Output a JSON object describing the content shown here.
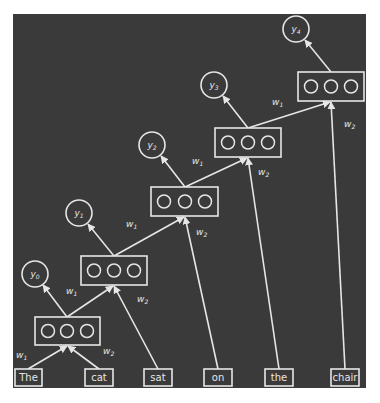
{
  "diagram": {
    "type": "recursive-neural-network (left-branching tree)",
    "colors": {
      "background": "#3a3a3a",
      "foreground": "#e6e6e6",
      "page": "#ffffff"
    },
    "words": [
      {
        "id": "w_the",
        "label": "The"
      },
      {
        "id": "w_cat",
        "label": "cat"
      },
      {
        "id": "w_sat",
        "label": "sat"
      },
      {
        "id": "w_on",
        "label": "on"
      },
      {
        "id": "w_the2",
        "label": "the"
      },
      {
        "id": "w_chair",
        "label": "chair"
      }
    ],
    "hidden_nodes": [
      {
        "id": "h0",
        "units": 3
      },
      {
        "id": "h1",
        "units": 3
      },
      {
        "id": "h2",
        "units": 3
      },
      {
        "id": "h3",
        "units": 3
      },
      {
        "id": "h4",
        "units": 3
      }
    ],
    "outputs": [
      {
        "id": "y0",
        "base": "y",
        "sub": "0"
      },
      {
        "id": "y1",
        "base": "y",
        "sub": "1"
      },
      {
        "id": "y2",
        "base": "y",
        "sub": "2"
      },
      {
        "id": "y3",
        "base": "y",
        "sub": "3"
      },
      {
        "id": "y4",
        "base": "y",
        "sub": "4"
      }
    ],
    "weights": {
      "w1": {
        "base": "w",
        "sub": "1"
      },
      "w2": {
        "base": "w",
        "sub": "2"
      }
    },
    "edges": [
      {
        "from": "The",
        "to": "h0",
        "weight": "w1"
      },
      {
        "from": "cat",
        "to": "h0",
        "weight": "w2"
      },
      {
        "from": "h0",
        "to": "h1",
        "weight": "w1"
      },
      {
        "from": "sat",
        "to": "h1",
        "weight": "w2"
      },
      {
        "from": "h1",
        "to": "h2",
        "weight": "w1"
      },
      {
        "from": "on",
        "to": "h2",
        "weight": "w2"
      },
      {
        "from": "h2",
        "to": "h3",
        "weight": "w1"
      },
      {
        "from": "the",
        "to": "h3",
        "weight": "w2"
      },
      {
        "from": "h3",
        "to": "h4",
        "weight": "w1"
      },
      {
        "from": "chair",
        "to": "h4",
        "weight": "w2"
      },
      {
        "from": "h0",
        "to": "y0"
      },
      {
        "from": "h1",
        "to": "y1"
      },
      {
        "from": "h2",
        "to": "y2"
      },
      {
        "from": "h3",
        "to": "y3"
      },
      {
        "from": "h4",
        "to": "y4"
      }
    ]
  }
}
